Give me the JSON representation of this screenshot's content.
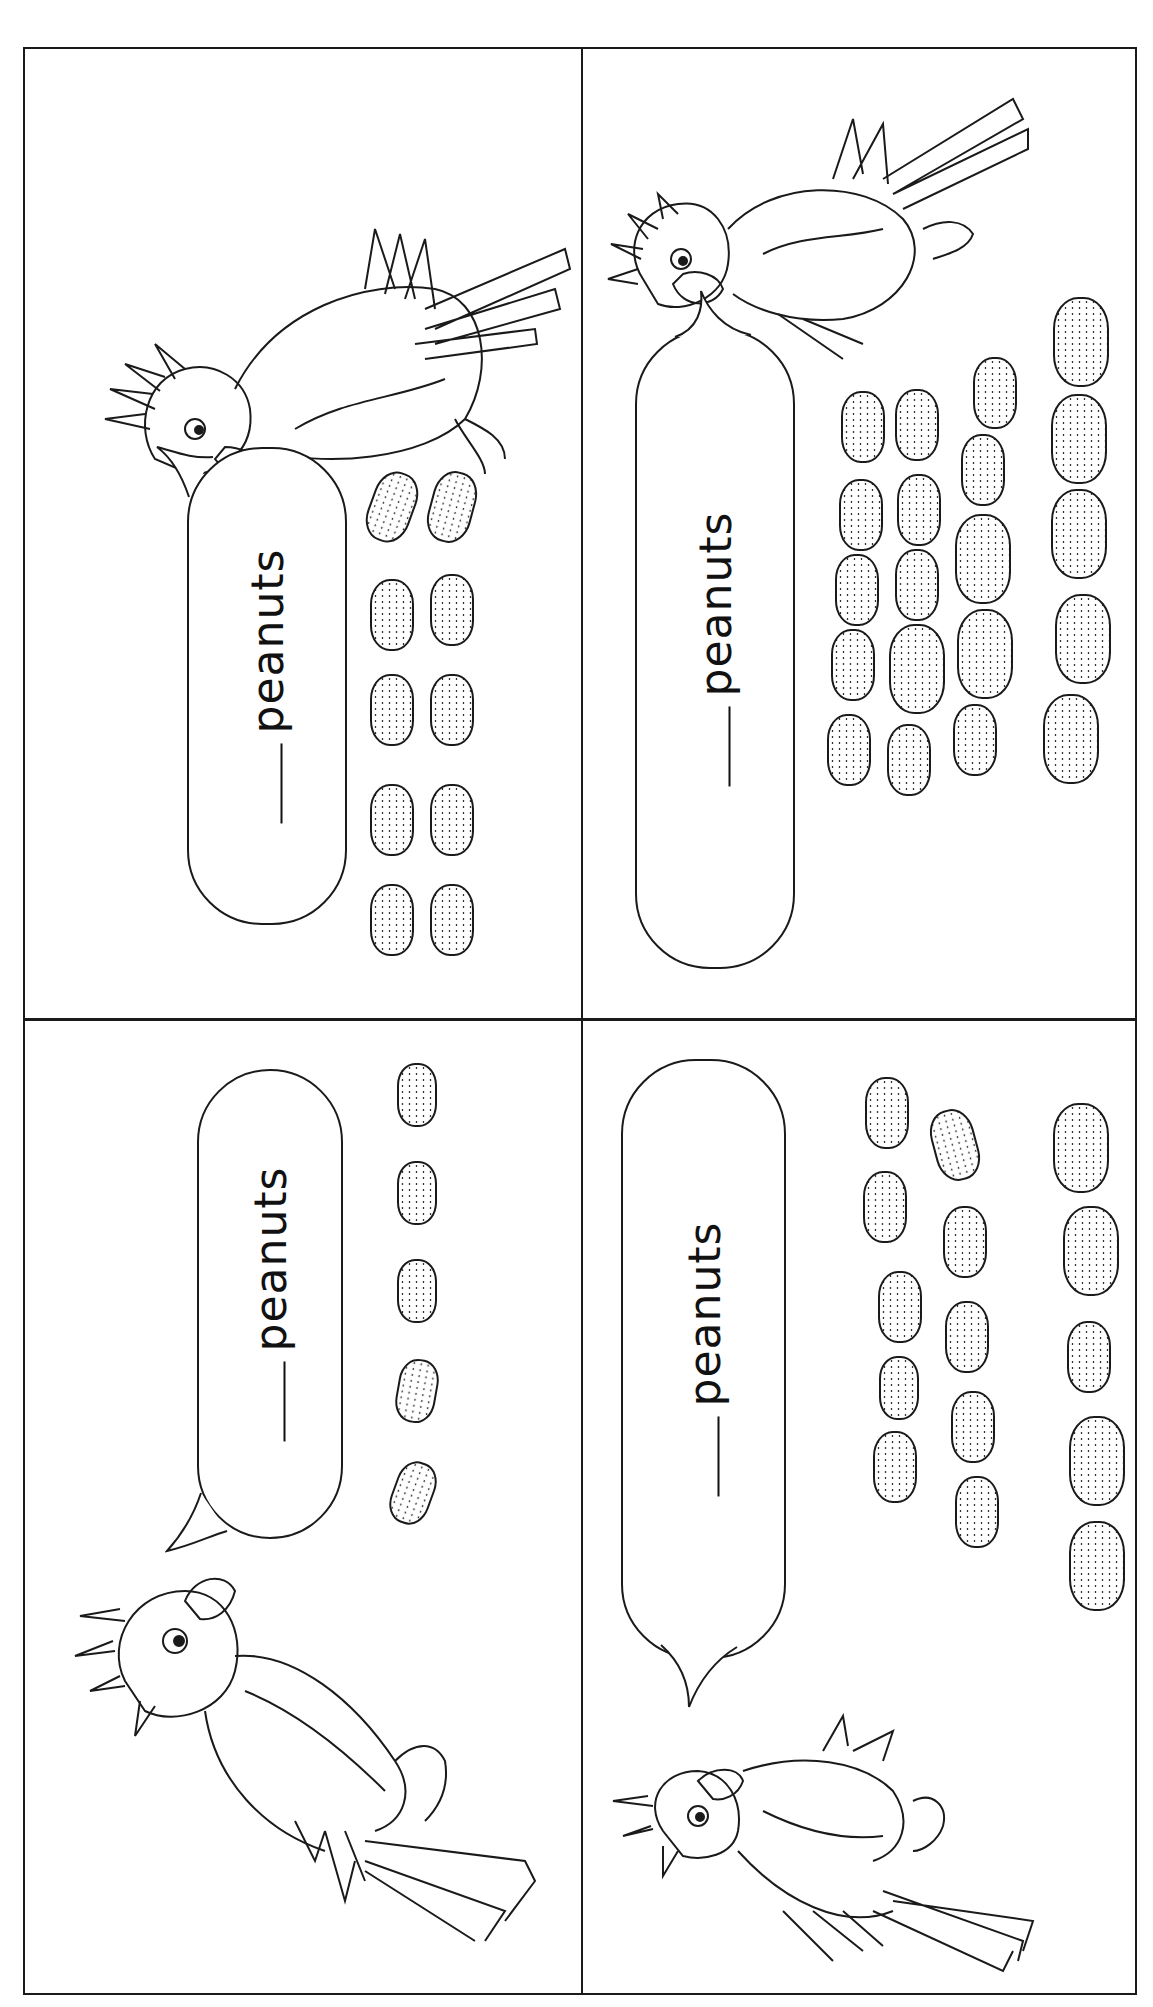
{
  "page": {
    "orientation": "content rotated 90 degrees (landscape worksheet printed on portrait page)",
    "layout": "2x2 grid of counting cards"
  },
  "cards": [
    {
      "position": "top-left",
      "bubble_blank": "___",
      "bubble_word": "peanuts",
      "peanut_count": 10,
      "character": "parrot-icon"
    },
    {
      "position": "top-right",
      "bubble_blank": "___",
      "bubble_word": "peanuts",
      "peanut_count": 20,
      "character": "parrot-icon"
    },
    {
      "position": "bottom-left",
      "bubble_blank": "___",
      "bubble_word": "peanuts",
      "peanut_count": 5,
      "character": "parrot-icon"
    },
    {
      "position": "bottom-right",
      "bubble_blank": "___",
      "bubble_word": "peanuts",
      "peanut_count": 15,
      "character": "parrot-icon"
    }
  ],
  "colors": {
    "line": "#1a1a1a",
    "paper": "#ffffff"
  }
}
